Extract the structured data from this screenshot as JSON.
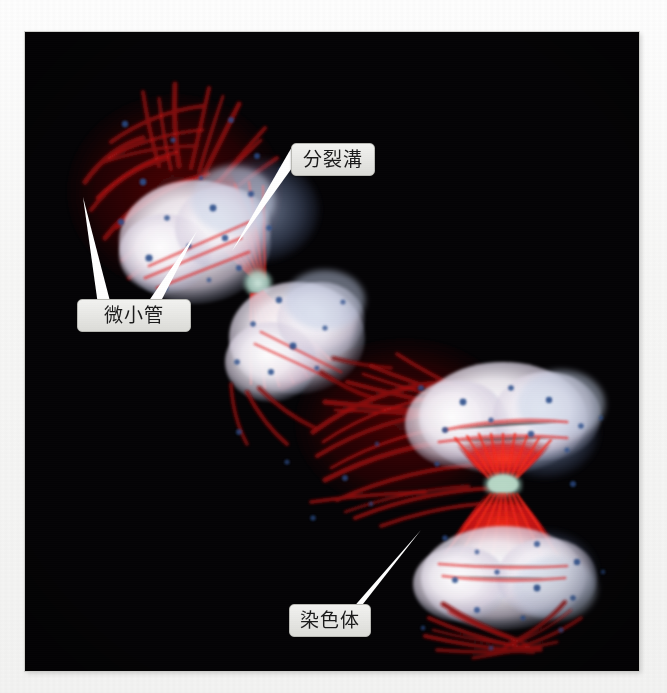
{
  "figure": {
    "kind": "fluorescence-micrograph",
    "background_color": "#f5f5f3",
    "photo_background": "#050406"
  },
  "palette": {
    "microtubule_red": "#d81414",
    "microtubule_dark_red": "#7a0c0c",
    "chromatin_white": "#f6f3f6",
    "chromatin_blue": "#9fb3d6",
    "dot_blue": "#2c4f8c",
    "midbody_cyan": "#a8ccc0",
    "label_fill": "#e8e8e5",
    "label_border": "#b9b9b4",
    "label_text": "#1a1a1a",
    "pointer_white": "#ffffff"
  },
  "labels": [
    {
      "id": "cleavage-furrow",
      "text": "分裂溝",
      "box": {
        "x": 291,
        "y": 143,
        "w": 82,
        "h": 31
      },
      "pointers": [
        {
          "from_x": 299,
          "from_y": 174,
          "to_x": 232,
          "to_y": 251,
          "width": 11
        }
      ]
    },
    {
      "id": "microtubules",
      "text": "微小管",
      "box": {
        "x": 77,
        "y": 299,
        "w": 112,
        "h": 31
      },
      "pointers": [
        {
          "from_x": 104,
          "from_y": 299,
          "to_x": 83,
          "to_y": 197,
          "width": 13
        },
        {
          "from_x": 152,
          "from_y": 299,
          "to_x": 197,
          "to_y": 231,
          "width": 13
        }
      ]
    },
    {
      "id": "chromosomes",
      "text": "染色体",
      "box": {
        "x": 289,
        "y": 604,
        "w": 80,
        "h": 31
      },
      "pointers": [
        {
          "from_x": 357,
          "from_y": 604,
          "to_x": 421,
          "to_y": 530,
          "width": 12
        }
      ]
    }
  ],
  "cells": [
    {
      "id": "upper-cell",
      "orientation": "diagonal",
      "midbody": {
        "x": 232,
        "y": 252
      },
      "poles": [
        {
          "name": "upper-left-pole",
          "x": 150,
          "y": 190
        },
        {
          "name": "lower-right-pole",
          "x": 300,
          "y": 320
        }
      ]
    },
    {
      "id": "lower-cell",
      "orientation": "vertical",
      "midbody": {
        "x": 477,
        "y": 452
      },
      "poles": [
        {
          "name": "top-pole",
          "x": 477,
          "y": 380
        },
        {
          "name": "bottom-pole",
          "x": 477,
          "y": 545
        }
      ]
    }
  ]
}
